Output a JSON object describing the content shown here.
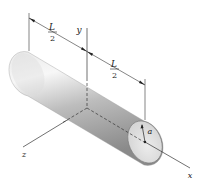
{
  "figure": {
    "type": "engineering-diagram",
    "labels": {
      "x_axis": "x",
      "y_axis": "y",
      "z_axis": "z",
      "radius": "a",
      "half_length_left_num": "L",
      "half_length_left_den": "2",
      "half_length_right_num": "L",
      "half_length_right_den": "2"
    },
    "colors": {
      "cylinder_light": "#f2f2f2",
      "cylinder_mid": "#c8c8c8",
      "cylinder_dark": "#8e8e8e",
      "end_face": "#e6e6e6",
      "lines": "#333333"
    }
  }
}
